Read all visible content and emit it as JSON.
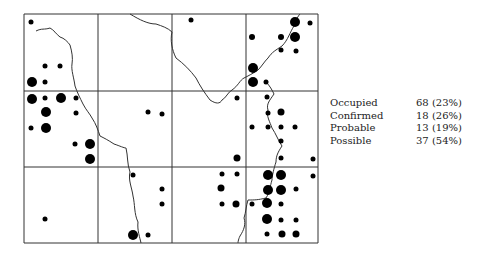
{
  "map": {
    "grid": {
      "x_lines": [
        24,
        98,
        172,
        246,
        318
      ],
      "y_lines": [
        14,
        91,
        167,
        243
      ],
      "color": "#333333"
    },
    "river_paths": [
      "M36,31 C42,28 44,30 50,28 C54,30 56,34 60,37 C64,38 68,42 70,45 C72,52 73,58 72,64 C71,70 74,78 75,86 C77,92 80,98 83,104 C86,110 90,114 92,118 C96,124 98,130 100,136 C104,138 108,140 114,144 C120,146 124,148 126,148 C128,156 127,164 130,172 C128,180 132,188 133,196 C135,204 134,214 138,222 C137,230 140,238 141,243",
      "M130,14 C140,20 148,24 156,24 C162,26 168,28 172,32 C170,40 172,50 176,58 C184,64 190,70 196,78 C200,86 204,92 210,100 C216,104 220,104 222,100 C226,98 228,92 232,90 C238,86 240,80 244,78 C248,76 252,74 258,70 C262,66 264,62 268,58 C272,52 276,50 282,46 C288,40 290,32 294,26 C296,20 298,16 300,14",
      "M266,82 C270,86 272,90 274,94 C270,100 266,104 268,110 C266,116 270,122 272,128 C276,134 278,140 282,146 C278,152 276,156 276,162 C274,168 272,176 272,180 C270,186 270,192 266,198 C258,200 254,200 248,200 C246,206 246,212 244,218 C246,224 244,230 240,236 C238,240 238,243 238,243"
    ],
    "dots": [
      {
        "x": 31,
        "y": 22,
        "r": 2.5
      },
      {
        "x": 45,
        "y": 66,
        "r": 2.5
      },
      {
        "x": 60,
        "y": 66,
        "r": 2.5
      },
      {
        "x": 32,
        "y": 82,
        "r": 5
      },
      {
        "x": 45,
        "y": 82,
        "r": 2.5
      },
      {
        "x": 32,
        "y": 99,
        "r": 5
      },
      {
        "x": 45,
        "y": 98,
        "r": 2.5
      },
      {
        "x": 61,
        "y": 98,
        "r": 5
      },
      {
        "x": 76,
        "y": 98,
        "r": 2.5
      },
      {
        "x": 46,
        "y": 112,
        "r": 5
      },
      {
        "x": 76,
        "y": 113,
        "r": 2.5
      },
      {
        "x": 31,
        "y": 128,
        "r": 2.5
      },
      {
        "x": 46,
        "y": 128,
        "r": 5
      },
      {
        "x": 75,
        "y": 144,
        "r": 2.5
      },
      {
        "x": 90,
        "y": 144,
        "r": 5
      },
      {
        "x": 90,
        "y": 159,
        "r": 5
      },
      {
        "x": 191,
        "y": 20,
        "r": 2.5
      },
      {
        "x": 148,
        "y": 112,
        "r": 2.5
      },
      {
        "x": 162,
        "y": 114,
        "r": 2.5
      },
      {
        "x": 295,
        "y": 22,
        "r": 5
      },
      {
        "x": 310,
        "y": 23,
        "r": 2.5
      },
      {
        "x": 252,
        "y": 37,
        "r": 3
      },
      {
        "x": 281,
        "y": 37,
        "r": 3
      },
      {
        "x": 295,
        "y": 37,
        "r": 5
      },
      {
        "x": 281,
        "y": 50,
        "r": 2.5
      },
      {
        "x": 296,
        "y": 51,
        "r": 2.5
      },
      {
        "x": 253,
        "y": 68,
        "r": 5
      },
      {
        "x": 253,
        "y": 82,
        "r": 5
      },
      {
        "x": 266,
        "y": 82,
        "r": 2.5
      },
      {
        "x": 237,
        "y": 98,
        "r": 2.5
      },
      {
        "x": 267,
        "y": 97,
        "r": 2.5
      },
      {
        "x": 268,
        "y": 113,
        "r": 2.5
      },
      {
        "x": 281,
        "y": 112,
        "r": 3.5
      },
      {
        "x": 252,
        "y": 127,
        "r": 2.5
      },
      {
        "x": 268,
        "y": 127,
        "r": 2.5
      },
      {
        "x": 281,
        "y": 127,
        "r": 2.5
      },
      {
        "x": 295,
        "y": 127,
        "r": 2.5
      },
      {
        "x": 281,
        "y": 141,
        "r": 2.5
      },
      {
        "x": 237,
        "y": 158,
        "r": 3.5
      },
      {
        "x": 281,
        "y": 158,
        "r": 2.5
      },
      {
        "x": 313,
        "y": 159,
        "r": 2.5
      },
      {
        "x": 133,
        "y": 175,
        "r": 2.5
      },
      {
        "x": 222,
        "y": 174,
        "r": 2.5
      },
      {
        "x": 237,
        "y": 174,
        "r": 2.5
      },
      {
        "x": 268,
        "y": 175,
        "r": 5
      },
      {
        "x": 281,
        "y": 175,
        "r": 5
      },
      {
        "x": 313,
        "y": 176,
        "r": 2.5
      },
      {
        "x": 162,
        "y": 189,
        "r": 2.5
      },
      {
        "x": 221,
        "y": 188,
        "r": 3.5
      },
      {
        "x": 268,
        "y": 190,
        "r": 5
      },
      {
        "x": 281,
        "y": 190,
        "r": 5
      },
      {
        "x": 296,
        "y": 189,
        "r": 2.5
      },
      {
        "x": 162,
        "y": 204,
        "r": 2.5
      },
      {
        "x": 222,
        "y": 204,
        "r": 2.5
      },
      {
        "x": 236,
        "y": 204,
        "r": 3.5
      },
      {
        "x": 252,
        "y": 204,
        "r": 2.5
      },
      {
        "x": 267,
        "y": 203,
        "r": 5
      },
      {
        "x": 281,
        "y": 204,
        "r": 2.5
      },
      {
        "x": 45,
        "y": 219,
        "r": 2.5
      },
      {
        "x": 267,
        "y": 219,
        "r": 5
      },
      {
        "x": 281,
        "y": 220,
        "r": 2.5
      },
      {
        "x": 296,
        "y": 220,
        "r": 2.5
      },
      {
        "x": 133,
        "y": 235,
        "r": 5
      },
      {
        "x": 148,
        "y": 235,
        "r": 2.5
      },
      {
        "x": 267,
        "y": 234,
        "r": 2.5
      },
      {
        "x": 282,
        "y": 234,
        "r": 3.5
      },
      {
        "x": 296,
        "y": 234,
        "r": 3.5
      }
    ]
  },
  "legend": {
    "rows": [
      {
        "label": "Occupied",
        "value": "68 (23%)"
      },
      {
        "label": "Confirmed",
        "value": "18 (26%)"
      },
      {
        "label": "Probable",
        "value": "13 (19%)"
      },
      {
        "label": "Possible",
        "value": "37 (54%)"
      }
    ]
  }
}
